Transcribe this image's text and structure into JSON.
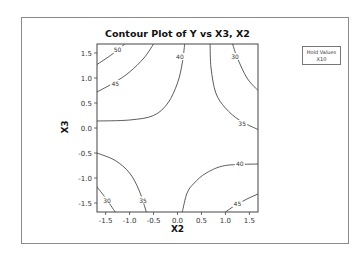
{
  "chart_data": {
    "type": "contour",
    "title": "Contour Plot of Y vs X3, X2",
    "xlabel": "X2",
    "ylabel": "X3",
    "xlim": [
      -1.68,
      1.68
    ],
    "ylim": [
      -1.68,
      1.68
    ],
    "x_ticks": [
      "-1.5",
      "-1.0",
      "-0.5",
      "0.0",
      "0.5",
      "1.0",
      "1.5"
    ],
    "y_ticks": [
      "1.5",
      "1.0",
      "0.5",
      "0.0",
      "-0.5",
      "-1.0",
      "-1.5"
    ],
    "grid": false,
    "legend": {
      "title": "Hold Values",
      "entries": [
        "X10"
      ],
      "position": "right"
    },
    "contour_levels": [
      {
        "level": 50,
        "label": "50",
        "region": "top-left",
        "points": [
          [
            -1.68,
            1.27
          ],
          [
            -1.4,
            1.45
          ],
          [
            -1.2,
            1.6
          ],
          [
            -1.1,
            1.68
          ]
        ]
      },
      {
        "level": 45,
        "label": "45",
        "region": "top-left",
        "points": [
          [
            -1.68,
            0.72
          ],
          [
            -1.3,
            0.92
          ],
          [
            -1.0,
            1.12
          ],
          [
            -0.7,
            1.4
          ],
          [
            -0.5,
            1.68
          ]
        ]
      },
      {
        "level": 40,
        "label": "40",
        "region": "top-left",
        "points": [
          [
            -1.68,
            0.14
          ],
          [
            -1.0,
            0.16
          ],
          [
            -0.5,
            0.25
          ],
          [
            -0.2,
            0.5
          ],
          [
            0.0,
            0.9
          ],
          [
            0.1,
            1.3
          ],
          [
            0.15,
            1.68
          ]
        ]
      },
      {
        "level": 35,
        "label": "35",
        "region": "top-right",
        "points": [
          [
            0.68,
            1.68
          ],
          [
            0.7,
            1.2
          ],
          [
            0.8,
            0.7
          ],
          [
            1.0,
            0.4
          ],
          [
            1.3,
            0.15
          ],
          [
            1.68,
            -0.03
          ]
        ]
      },
      {
        "level": 30,
        "label": "30",
        "region": "top-right",
        "points": [
          [
            1.15,
            1.68
          ],
          [
            1.25,
            1.4
          ],
          [
            1.45,
            1.0
          ],
          [
            1.68,
            0.75
          ]
        ]
      },
      {
        "level": 35,
        "label": "35",
        "region": "bottom-left",
        "points": [
          [
            -1.68,
            -0.5
          ],
          [
            -1.3,
            -0.65
          ],
          [
            -1.0,
            -0.9
          ],
          [
            -0.8,
            -1.25
          ],
          [
            -0.65,
            -1.68
          ]
        ]
      },
      {
        "level": 30,
        "label": "30",
        "region": "bottom-left",
        "points": [
          [
            -1.68,
            -1.18
          ],
          [
            -1.5,
            -1.4
          ],
          [
            -1.3,
            -1.68
          ]
        ]
      },
      {
        "level": 40,
        "label": "40",
        "region": "bottom-right",
        "points": [
          [
            0.1,
            -1.68
          ],
          [
            0.2,
            -1.3
          ],
          [
            0.35,
            -1.1
          ],
          [
            0.6,
            -0.9
          ],
          [
            1.0,
            -0.75
          ],
          [
            1.68,
            -0.72
          ]
        ]
      },
      {
        "level": 45,
        "label": "45",
        "region": "bottom-right",
        "points": [
          [
            1.0,
            -1.68
          ],
          [
            1.2,
            -1.55
          ],
          [
            1.45,
            -1.42
          ],
          [
            1.68,
            -1.32
          ]
        ]
      }
    ]
  },
  "labels": {
    "title": "Contour Plot of Y vs X3, X2",
    "xlabel": "X2",
    "ylabel": "X3",
    "legend_title": "Hold Values",
    "legend_entry": "X10"
  }
}
